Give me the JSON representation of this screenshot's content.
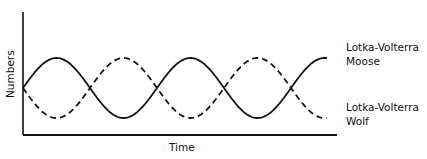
{
  "chart_data": {
    "type": "line",
    "title": "",
    "xlabel": "Time",
    "ylabel": "Numbers",
    "axis_ticks": "none",
    "grid": false,
    "legend_position": "right, inline labels",
    "x": [
      0,
      0.25,
      0.5,
      0.75,
      1.0,
      1.25,
      1.5,
      1.75,
      2.0,
      2.25,
      2.5
    ],
    "x_note": "Time in cycles (unlabeled axis); approx 2.25 cycles shown",
    "series": [
      {
        "name": "Lotka-Volterra Moose",
        "style": "solid",
        "values": [
          0,
          1,
          0,
          -1,
          0,
          1,
          0,
          -1,
          0,
          1,
          0
        ],
        "note": "relative sinusoid, starts at midline rising, ends near peak"
      },
      {
        "name": "Lotka-Volterra Wolf",
        "style": "dashed",
        "values": [
          0,
          -1,
          0,
          1,
          0,
          -1,
          0,
          1,
          0,
          -1,
          0
        ],
        "note": "relative sinusoid, inverse phase of moose, ends near trough"
      }
    ],
    "plot": {
      "origin_px": [
        23,
        135
      ],
      "x_axis_end_px": 337,
      "y_axis_top_px": 12,
      "curve_start_x_px": 23,
      "curve_end_x_px": 327,
      "center_y_px": 88,
      "amplitude_px": 30,
      "period_px": 134
    }
  },
  "labels": {
    "moose_line1": "Lotka-Volterra",
    "moose_line2": "Moose",
    "wolf_line1": "Lotka-Volterra",
    "wolf_line2": "Wolf",
    "xlabel": "Time",
    "ylabel": "Numbers"
  },
  "colors": {
    "ink": "#111111",
    "background": "#ffffff"
  }
}
